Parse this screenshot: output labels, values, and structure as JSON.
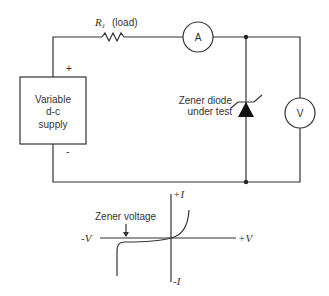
{
  "circuit": {
    "resistor_label": "R",
    "resistor_sub": "1",
    "resistor_note": "(load)",
    "ammeter": "A",
    "voltmeter": "V",
    "supply_lines": [
      "Variable",
      "d-c",
      "supply"
    ],
    "plus": "+",
    "minus": "-",
    "diode_label_lines": [
      "Zener diode",
      "under test"
    ]
  },
  "graph": {
    "y_pos": "+I",
    "y_neg": "-I",
    "x_neg": "-V",
    "x_pos": "+V",
    "annotation": "Zener voltage"
  }
}
